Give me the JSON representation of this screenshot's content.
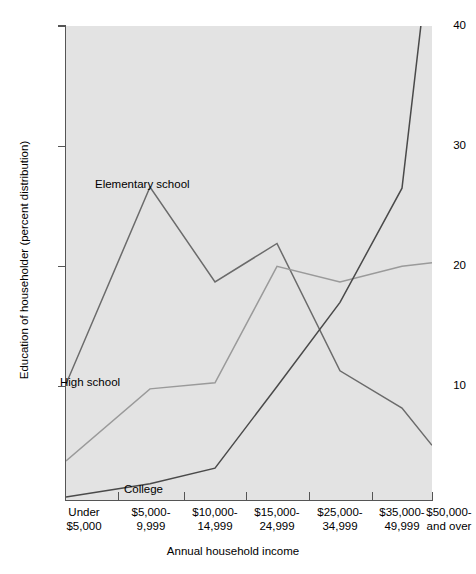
{
  "chart_data": {
    "type": "line",
    "title": "",
    "xlabel": "Annual household income",
    "ylabel": "Education of householder (percent distribution)",
    "categories": [
      "Under $5,000",
      "$5,000-9,999",
      "$10,000-14,999",
      "$15,000-24,999",
      "$25,000-34,999",
      "$35,000-49,999",
      "$50,000-and over"
    ],
    "category_lines": [
      [
        "Under",
        "$5,000"
      ],
      [
        "$5,000-",
        "9,999"
      ],
      [
        "$10,000-",
        "14,999"
      ],
      [
        "$15,000-",
        "24,999"
      ],
      [
        "$25,000-",
        "34,999"
      ],
      [
        "$35,000-",
        "49,999"
      ],
      [
        "$50,000-",
        "and over"
      ]
    ],
    "series": [
      {
        "name": "Elementary school",
        "color": "#6b6b6b",
        "values": [
          10.2,
          26.6,
          18.7,
          21.9,
          11.3,
          8.2,
          5.1
        ]
      },
      {
        "name": "High school",
        "color": "#9a9a9a",
        "values": [
          3.8,
          9.8,
          10.3,
          20.0,
          18.7,
          20.0,
          20.3
        ]
      },
      {
        "name": "College",
        "color": "#4a4a4a",
        "values": [
          0.8,
          1.9,
          3.2,
          10.0,
          17.0,
          26.5,
          48.0
        ]
      }
    ],
    "ylim": [
      0.55,
      40
    ],
    "yticks": [
      10,
      20,
      30,
      40
    ],
    "ytick_labels": [
      "10",
      "20",
      "30",
      "40"
    ],
    "grid": false,
    "legend": "inline-annotations",
    "annotations": [
      {
        "text": "Elementary school",
        "x": 95,
        "y": 178
      },
      {
        "text": "High school",
        "x": 60,
        "y": 376
      },
      {
        "text": "College",
        "x": 124,
        "y": 483
      }
    ],
    "plot_background": "#e3e3e3"
  }
}
